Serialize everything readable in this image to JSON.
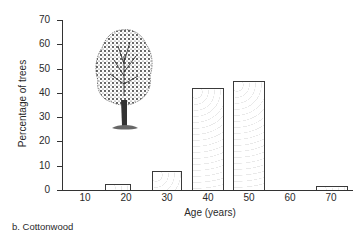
{
  "chart_data": {
    "type": "bar",
    "title": "",
    "subtitle": "",
    "caption": "b. Cottonwood",
    "xlabel": "Age (years)",
    "ylabel": "Percentage of trees",
    "categories": [
      "10",
      "20",
      "30",
      "40",
      "50",
      "60",
      "70"
    ],
    "values": [
      0,
      2.5,
      8,
      42,
      45,
      0,
      1.5
    ],
    "ylim": [
      0,
      70
    ],
    "yticks": [
      0,
      10,
      20,
      30,
      40,
      50,
      60,
      70
    ],
    "xticks": [
      10,
      20,
      30,
      40,
      50,
      60,
      70
    ],
    "grid": false,
    "legend": null,
    "annotations": [
      "tree illustration (cottonwood) in upper-left of plot area"
    ]
  },
  "labels": {
    "y_ticks": [
      "0",
      "10",
      "20",
      "30",
      "40",
      "50",
      "60",
      "70"
    ],
    "x_ticks": [
      "10",
      "20",
      "30",
      "40",
      "50",
      "60",
      "70"
    ]
  },
  "colors": {
    "axis": "#333333",
    "bar_border": "#3a3a3a",
    "bar_fill": "#ffffff",
    "text": "#2a2a2a"
  }
}
